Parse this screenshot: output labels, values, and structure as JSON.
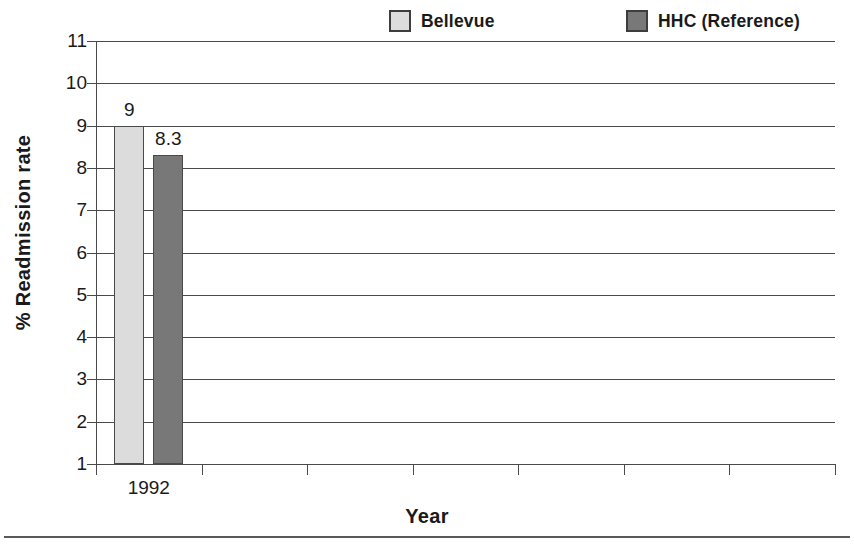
{
  "chart_data": {
    "type": "bar",
    "title": "",
    "subtitle": "",
    "xlabel": "Year",
    "ylabel": "% Readmission rate",
    "categories": [
      "1992"
    ],
    "series": [
      {
        "name": "Bellevue",
        "values": [
          9
        ],
        "labels": [
          "9"
        ],
        "color": "#dcdcdc"
      },
      {
        "name": "HHC (Reference)",
        "values": [
          8.3
        ],
        "labels": [
          "8.3"
        ],
        "color": "#787878"
      }
    ],
    "ylim": [
      1,
      11
    ],
    "ytick_labels": [
      "1",
      "2",
      "3",
      "4",
      "5",
      "6",
      "7",
      "8",
      "9",
      "10",
      "11"
    ],
    "ytick_values": [
      1,
      2,
      3,
      4,
      5,
      6,
      7,
      8,
      9,
      10,
      11
    ],
    "grid": true,
    "grid_axis": "y",
    "legend_position": "top",
    "xtick_count": 8,
    "category_slots": 7,
    "bar_outline_color": "#4a4a4a",
    "axis_color": "#4a4a4a",
    "background_color": "#ffffff",
    "text_color": "#1a1a1a"
  },
  "legend": {
    "entries": [
      {
        "label": "Bellevue",
        "color": "#dcdcdc"
      },
      {
        "label": "HHC (Reference)",
        "color": "#787878"
      }
    ]
  },
  "axes": {
    "x_title": "Year",
    "y_title": "% Readmission rate"
  }
}
